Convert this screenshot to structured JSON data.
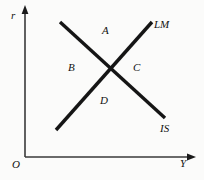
{
  "figure": {
    "background_color": "#fbfbfa",
    "ink_color": "#111111",
    "axis_color": "#3a3a3a",
    "axes": {
      "vertical_label": "r",
      "horizontal_label": "Y",
      "origin_label": "O"
    },
    "curves": [
      {
        "name": "LM",
        "label": "LM",
        "slope": "upward",
        "start": [
          56,
          130
        ],
        "end": [
          152,
          22
        ]
      },
      {
        "name": "IS",
        "label": "IS",
        "slope": "downward",
        "start": [
          60,
          22
        ],
        "end": [
          165,
          118
        ]
      }
    ],
    "intersection": [
      110,
      70
    ],
    "regions": [
      {
        "id": "A",
        "label": "A",
        "position": "above-intersection"
      },
      {
        "id": "B",
        "label": "B",
        "position": "left-of-intersection"
      },
      {
        "id": "C",
        "label": "C",
        "position": "right-of-intersection"
      },
      {
        "id": "D",
        "label": "D",
        "position": "below-intersection"
      }
    ]
  }
}
